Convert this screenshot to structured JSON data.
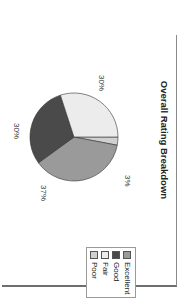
{
  "chart_data": {
    "type": "pie",
    "title": "Overall Rating Breakdown",
    "categories": [
      "Excellent",
      "Good",
      "Fair",
      "Poor"
    ],
    "values": [
      37,
      30,
      30,
      3
    ],
    "labels": [
      "37%",
      "30%",
      "30%",
      "3%"
    ],
    "colors": [
      "#9a9a9a",
      "#4a4a4a",
      "#ececec",
      "#d0d0d0"
    ],
    "legend_position": "right",
    "rotation_deg": 90
  },
  "legend": {
    "items": [
      {
        "label": "Excellent",
        "color": "#9a9a9a"
      },
      {
        "label": "Good",
        "color": "#4a4a4a"
      },
      {
        "label": "Fair",
        "color": "#ececec"
      },
      {
        "label": "Poor",
        "color": "#d0d0d0"
      }
    ]
  }
}
